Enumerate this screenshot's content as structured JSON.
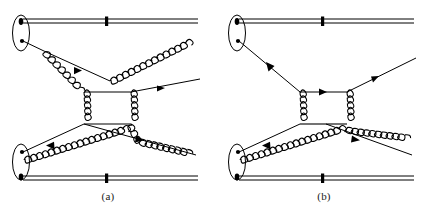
{
  "figure": {
    "kind": "feynman-diagram-pair",
    "width": 432,
    "height": 216,
    "background_color": "#ffffff",
    "line_color": "#000000",
    "label_color": "#1a1a1a"
  },
  "panels": [
    {
      "id": "a",
      "label": "(a)",
      "title": "box diagram with four gluon legs",
      "elements": {
        "upper_hadron_blob": "ellipse",
        "lower_hadron_blob": "ellipse",
        "upper_spectator_line": "double-line-with-tick",
        "lower_spectator_line": "double-line-with-tick",
        "central_loop": "gluon-box",
        "incoming_quark_count": 2,
        "outgoing_quark_count": 2,
        "gluon_count": 4,
        "blob_vertex_dots": 4
      }
    },
    {
      "id": "b",
      "label": "(b)",
      "title": "box diagram with two gluon legs",
      "elements": {
        "upper_hadron_blob": "ellipse",
        "lower_hadron_blob": "ellipse",
        "upper_spectator_line": "double-line-with-tick",
        "lower_spectator_line": "double-line-with-tick",
        "central_loop": "gluon-box",
        "incoming_quark_count": 2,
        "outgoing_quark_count": 2,
        "gluon_count": 2,
        "blob_vertex_dots": 4
      }
    }
  ],
  "legend": {
    "straight_line_with_arrow": "quark propagator",
    "coiled_line": "gluon propagator",
    "double_straight_line": "spectator / beam remnant",
    "filled_ellipse": "hadron",
    "filled_dot": "parton vertex"
  }
}
